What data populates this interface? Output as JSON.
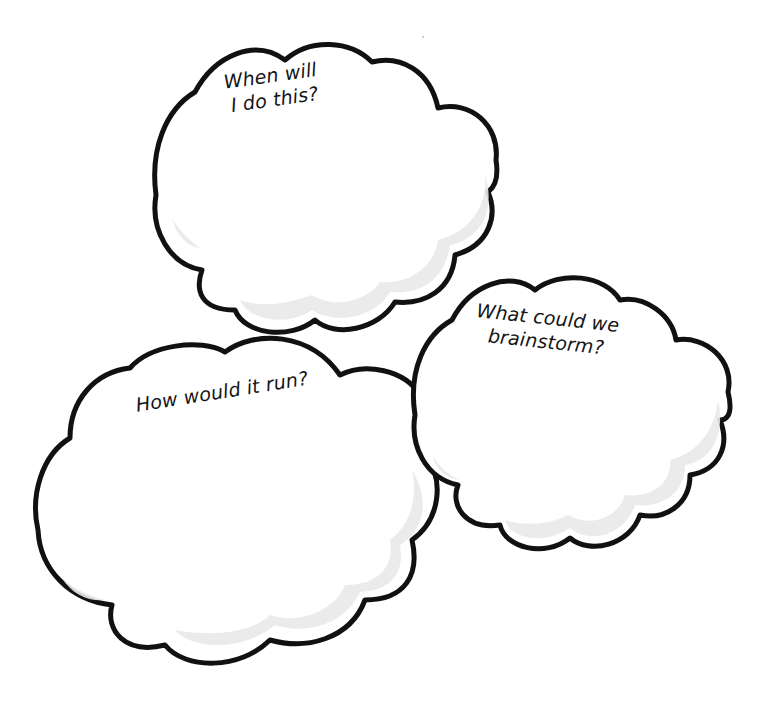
{
  "page": {
    "background": "#ffffff",
    "outline_color": "#111111",
    "shade_color": "#e9e9e9"
  },
  "clouds": [
    {
      "id": "when",
      "label_lines": [
        "When will",
        "I do this?"
      ]
    },
    {
      "id": "brainstorm",
      "label_lines": [
        "What could we",
        "brainstorm?"
      ]
    },
    {
      "id": "how",
      "label_lines": [
        "How would it run?"
      ]
    }
  ]
}
